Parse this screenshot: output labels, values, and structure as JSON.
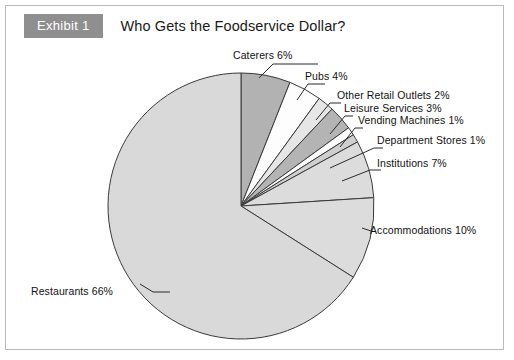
{
  "header": {
    "badge_label": "Exhibit 1",
    "title": "Who Gets the Foodservice Dollar?",
    "badge_color": "#8f8f8f"
  },
  "chart_data": {
    "type": "pie",
    "title": "Who Gets the Foodservice Dollar?",
    "units": "percent",
    "total": 100,
    "start_angle_deg": 0,
    "direction": "clockwise",
    "legend": "none (direct labels with leader lines)",
    "categories": [
      "Caterers",
      "Pubs",
      "Other Retail Outlets",
      "Leisure Services",
      "Vending Machines",
      "Department Stores",
      "Institutions",
      "Accommodations",
      "Restaurants"
    ],
    "values": [
      6,
      4,
      2,
      3,
      1,
      1,
      7,
      10,
      66
    ],
    "labels": [
      "Caterers 6%",
      "Pubs 4%",
      "Other Retail Outlets 2%",
      "Leisure Services 3%",
      "Vending Machines 1%",
      "Department Stores 1%",
      "Institutions 7%",
      "Accommodations 10%",
      "Restaurants 66%"
    ],
    "colors": [
      "#b2b2b2",
      "#fdfdfd",
      "#e6e6e6",
      "#b4b4b4",
      "#fdfdfd",
      "#cfcfcf",
      "#dcdcdc",
      "#dcdcdc",
      "#d9d9d9"
    ],
    "slice_outline_color": "#3a3a3a"
  }
}
